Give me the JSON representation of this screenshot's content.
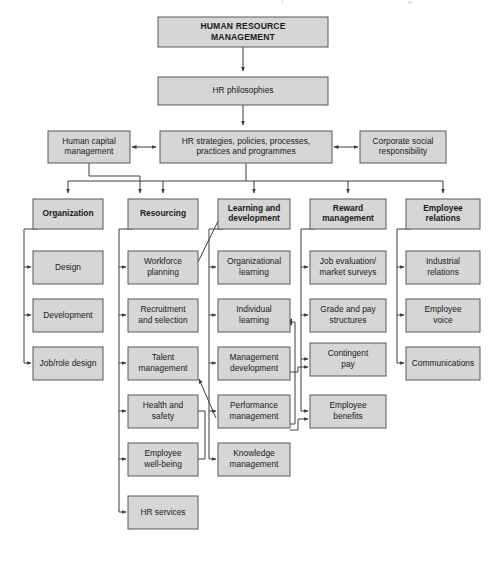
{
  "diagram": {
    "title_box": {
      "id": "human-resource-management",
      "lines": [
        "HUMAN RESOURCE",
        "MANAGEMENT"
      ],
      "x": 158,
      "y": 17,
      "w": 170,
      "h": 30,
      "style": "title"
    },
    "philosophies_box": {
      "id": "hr-philosophies",
      "lines": [
        "HR philosophies"
      ],
      "x": 158,
      "y": 77,
      "w": 170,
      "h": 28,
      "style": "normal"
    },
    "strategies_box": {
      "id": "hr-strategies",
      "lines": [
        "HR strategies, policies, processes,",
        "practices and programmes"
      ],
      "x": 160,
      "y": 131,
      "w": 172,
      "h": 32,
      "style": "normal"
    },
    "left_side_box": {
      "id": "human-capital-management",
      "lines": [
        "Human capital",
        "management"
      ],
      "x": 48,
      "y": 131,
      "w": 82,
      "h": 32,
      "style": "normal"
    },
    "right_side_box": {
      "id": "corporate-social-responsibility",
      "lines": [
        "Corporate social",
        "responsibility"
      ],
      "x": 360,
      "y": 131,
      "w": 86,
      "h": 32,
      "style": "normal"
    },
    "columns": [
      {
        "id": "organization",
        "header": {
          "lines": [
            "Organization"
          ]
        },
        "x": 33,
        "w": 70,
        "items": [
          {
            "id": "design",
            "lines": [
              "Design"
            ]
          },
          {
            "id": "development",
            "lines": [
              "Development"
            ]
          },
          {
            "id": "job-role-design",
            "lines": [
              "Job/role design"
            ]
          }
        ]
      },
      {
        "id": "resourcing",
        "header": {
          "lines": [
            "Resourcing"
          ]
        },
        "x": 128,
        "w": 70,
        "items": [
          {
            "id": "workforce-planning",
            "lines": [
              "Workforce",
              "planning"
            ]
          },
          {
            "id": "recruitment-and-selection",
            "lines": [
              "Recruitment",
              "and selection"
            ]
          },
          {
            "id": "talent-management",
            "lines": [
              "Talent",
              "management"
            ]
          },
          {
            "id": "health-and-safety",
            "lines": [
              "Health and",
              "safety"
            ]
          },
          {
            "id": "employee-well-being",
            "lines": [
              "Employee",
              "well-being"
            ]
          },
          {
            "id": "hr-services",
            "lines": [
              "HR services"
            ]
          }
        ]
      },
      {
        "id": "learning-and-development",
        "header": {
          "lines": [
            "Learning and",
            "development"
          ]
        },
        "x": 218,
        "w": 72,
        "items": [
          {
            "id": "organizational-learning",
            "lines": [
              "Organizational",
              "learning"
            ]
          },
          {
            "id": "individual-learning",
            "lines": [
              "Individual",
              "learning"
            ]
          },
          {
            "id": "management-development",
            "lines": [
              "Management",
              "development"
            ]
          },
          {
            "id": "performance-management",
            "lines": [
              "Performance",
              "management"
            ]
          },
          {
            "id": "knowledge-management",
            "lines": [
              "Knowledge",
              "management"
            ]
          }
        ]
      },
      {
        "id": "reward-management",
        "header": {
          "lines": [
            "Reward",
            "management"
          ]
        },
        "x": 310,
        "w": 76,
        "items": [
          {
            "id": "job-evaluation-market-surveys",
            "lines": [
              "Job evaluation/",
              "market surveys"
            ]
          },
          {
            "id": "grade-and-pay-structures",
            "lines": [
              "Grade and pay",
              "structures"
            ]
          },
          {
            "id": "contingent-pay",
            "lines": [
              "Contingent",
              "pay"
            ]
          },
          {
            "id": "employee-benefits",
            "lines": [
              "Employee",
              "benefits"
            ]
          }
        ]
      },
      {
        "id": "employee-relations",
        "header": {
          "lines": [
            "Employee",
            "relations"
          ]
        },
        "x": 406,
        "w": 74,
        "items": [
          {
            "id": "industrial-relations",
            "lines": [
              "Industrial",
              "relations"
            ]
          },
          {
            "id": "employee-voice",
            "lines": [
              "Employee",
              "voice"
            ]
          },
          {
            "id": "communications",
            "lines": [
              "Communications"
            ]
          }
        ]
      }
    ],
    "layout": {
      "header_y": 199,
      "header_h": 30,
      "item_y0": 251,
      "item_h": 33,
      "item_pitch": 48
    },
    "colors": {
      "box_fill": "#d6d6d6",
      "box_border": "#58585a",
      "connector": "#3d3d3d",
      "text": "#1a1a1a",
      "background": "#ffffff"
    }
  }
}
